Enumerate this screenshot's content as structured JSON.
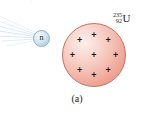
{
  "figure": {
    "caption": "(a)",
    "background_color": "#ffffff"
  },
  "projectile": {
    "name": "neutron",
    "label": "n",
    "fill_color": "#cfe3ee",
    "border_color": "#8fb0c4",
    "trail": {
      "name": "motion-trail",
      "color": "#cfe2ee",
      "streak_count": 7
    }
  },
  "nucleus": {
    "name": "uranium-235-nucleus",
    "fill_color": "#ef9f8f",
    "highlight_color": "#fdeeea",
    "border_color": "#c9705f",
    "charge_symbol": "+",
    "charge_count": 9,
    "charges": [
      {
        "x": 50,
        "y": 17
      },
      {
        "x": 27,
        "y": 26
      },
      {
        "x": 73,
        "y": 26
      },
      {
        "x": 15,
        "y": 50
      },
      {
        "x": 50,
        "y": 50
      },
      {
        "x": 85,
        "y": 50
      },
      {
        "x": 27,
        "y": 74
      },
      {
        "x": 73,
        "y": 74
      },
      {
        "x": 50,
        "y": 83
      }
    ]
  },
  "isotope_label": {
    "name": "uranium-235-label",
    "mass_number": "235",
    "atomic_number": "92",
    "symbol": "U"
  },
  "crop_remnants": {
    "left": "··",
    "center": "·",
    "right": "·"
  }
}
